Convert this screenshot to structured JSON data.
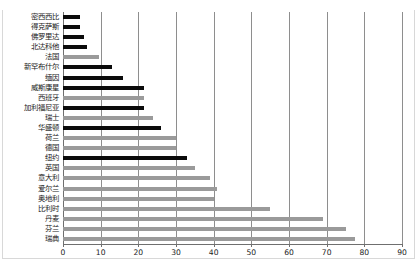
{
  "chart_data": {
    "type": "bar",
    "orientation": "horizontal",
    "title": "",
    "xlabel": "",
    "ylabel": "",
    "xlim": [
      0,
      90
    ],
    "xticks": [
      0,
      10,
      20,
      30,
      40,
      50,
      60,
      70,
      80,
      90
    ],
    "xtick_labels": [
      "0",
      "10",
      "20",
      "30",
      "40",
      "50",
      "60",
      "70",
      "80",
      "90"
    ],
    "grid": true,
    "grid_axis": "x",
    "legend": "none",
    "categories": [
      "密西西比",
      "得克萨斯",
      "佛罗里达",
      "北达科他",
      "法国",
      "新罕布什尔",
      "缅因",
      "威斯康星",
      "西班牙",
      "加利福尼亚",
      "瑞士",
      "华盛顿",
      "荷兰",
      "德国",
      "纽约",
      "英国",
      "意大利",
      "爱尔兰",
      "奥地利",
      "比利时",
      "丹麦",
      "芬兰",
      "瑞典"
    ],
    "values": [
      4.5,
      4.5,
      5.5,
      6.5,
      9.5,
      13,
      16,
      21.5,
      21.5,
      21.5,
      24,
      26,
      30,
      30,
      33,
      35,
      39,
      41,
      40,
      55,
      69,
      75,
      77.5
    ],
    "bar_colors": [
      "dark",
      "dark",
      "dark",
      "dark",
      "light",
      "dark",
      "dark",
      "dark",
      "light",
      "dark",
      "light",
      "dark",
      "light",
      "light",
      "dark",
      "light",
      "light",
      "light",
      "light",
      "light",
      "light",
      "light",
      "light"
    ],
    "colors": {
      "dark": "#0b0b0b",
      "light": "#9a9a9a",
      "gridline": "#8e8e8e",
      "axis": "#6f6f6f",
      "text": "#1a1a1a"
    }
  }
}
